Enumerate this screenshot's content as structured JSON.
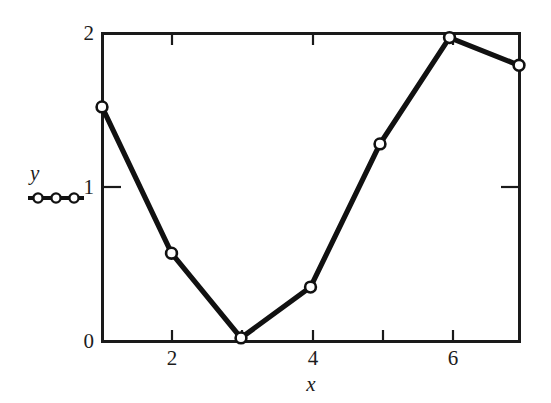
{
  "figure": {
    "background_color": "#ffffff",
    "ink_color": "#1a1a1a"
  },
  "legend": {
    "series_label": "y",
    "marker_icon": "open-circle-marker",
    "marker_count": 3,
    "line_icon": "legend-line"
  },
  "axes": {
    "x_title": "x",
    "y_title": "y",
    "x_tick_labels": [
      "2",
      "4",
      "6"
    ],
    "y_tick_labels": [
      "0",
      "1",
      "2"
    ]
  },
  "chart_data": {
    "type": "line",
    "title": "",
    "subtitle": "",
    "xlabel": "x",
    "ylabel": "y",
    "xlim": [
      1,
      7
    ],
    "ylim": [
      0,
      2
    ],
    "grid": false,
    "legend_position": "left-outside",
    "x_ticks_major": [
      2,
      4,
      6
    ],
    "x_ticks_minor": [
      3,
      5,
      7
    ],
    "y_ticks_major": [
      0,
      1,
      2
    ],
    "tick_direction": "in",
    "frame": "box",
    "x": [
      1,
      2,
      3,
      4,
      5,
      6,
      7
    ],
    "series": [
      {
        "name": "y",
        "marker": "open-circle",
        "line_color": "#111111",
        "marker_face_color": "#ffffff",
        "marker_edge_color": "#111111",
        "values": [
          1.52,
          0.57,
          0.02,
          0.35,
          1.28,
          1.97,
          1.79
        ]
      }
    ],
    "annotations": []
  }
}
